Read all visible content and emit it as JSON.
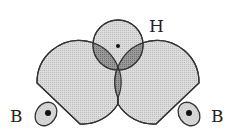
{
  "diagram": {
    "type": "orbital-overlap",
    "labels": {
      "hydrogen": "H",
      "boron_left": "B",
      "boron_right": "B"
    },
    "colors": {
      "lobe_fill": "#d4d4d4",
      "overlap_fill": "#8a8a8a",
      "stroke": "#333333",
      "nucleus": "#111111",
      "background": "#ffffff"
    },
    "nodes": [
      {
        "id": "H",
        "label": "H",
        "kind": "s-orbital",
        "center": [
          118,
          45
        ]
      },
      {
        "id": "B1",
        "label": "B",
        "kind": "boron-atom",
        "center": [
          46,
          114
        ]
      },
      {
        "id": "B2",
        "label": "B",
        "kind": "boron-atom",
        "center": [
          189,
          114
        ]
      }
    ],
    "edges": [
      {
        "from": "B1",
        "to": "H",
        "kind": "orbital-overlap"
      },
      {
        "from": "B2",
        "to": "H",
        "kind": "orbital-overlap"
      },
      {
        "from": "B1",
        "to": "B2",
        "kind": "lobe-overlap"
      }
    ]
  }
}
